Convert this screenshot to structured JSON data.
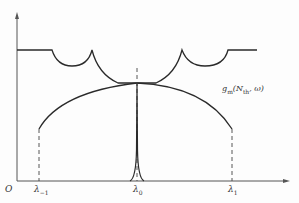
{
  "diagram": {
    "type": "spectrum-gain-diagram",
    "origin_label": "O",
    "x_ticks": [
      {
        "id": "lambda_minus1",
        "base": "λ",
        "sub": "−1"
      },
      {
        "id": "lambda_0",
        "base": "λ",
        "sub": "0"
      },
      {
        "id": "lambda_1",
        "base": "λ",
        "sub": "1"
      }
    ],
    "curve_label": {
      "prefix": "g",
      "prefix_sub": "m",
      "middle": "(N",
      "middle_sub": "th",
      "suffix": ", ω)"
    },
    "colors": {
      "line": "#2a2a2a",
      "axis": "#555555",
      "dash": "#444444"
    }
  }
}
